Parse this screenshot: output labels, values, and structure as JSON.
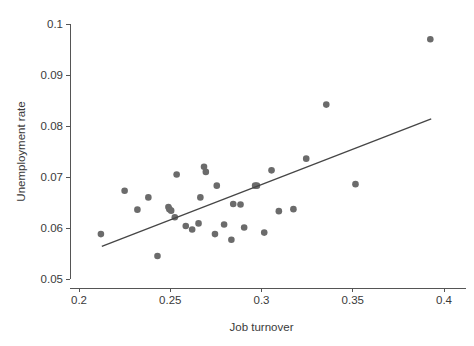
{
  "chart_data": {
    "type": "scatter",
    "title": "",
    "xlabel": "Job turnover",
    "ylabel": "Unemployment rate",
    "xlim": [
      0.2,
      0.4
    ],
    "ylim": [
      0.05,
      0.1
    ],
    "grid": false,
    "legend": null,
    "xticks": [
      0.2,
      0.25,
      0.3,
      0.35,
      0.4
    ],
    "xticklabels": [
      "0.2",
      "0.25",
      "0.3",
      "0.35",
      "0.4"
    ],
    "yticks": [
      0.05,
      0.06,
      0.07,
      0.08,
      0.09,
      0.1
    ],
    "yticklabels": [
      "0.05",
      "0.06",
      "0.07",
      "0.08",
      "0.09",
      "0.1"
    ],
    "marker_color": "#6b6b6b",
    "marker_shape": "circle",
    "marker_size": 4.6,
    "series": [
      {
        "name": "observations",
        "x": [
          0.212,
          0.225,
          0.232,
          0.238,
          0.243,
          0.249,
          0.2495,
          0.2505,
          0.2525,
          0.2535,
          0.2585,
          0.262,
          0.2655,
          0.2665,
          0.2685,
          0.2695,
          0.2745,
          0.2755,
          0.2795,
          0.2835,
          0.2845,
          0.2885,
          0.2905,
          0.2965,
          0.2975,
          0.3015,
          0.3055,
          0.3095,
          0.3175,
          0.3245,
          0.3355,
          0.3515,
          0.3925
        ],
        "y": [
          0.0588,
          0.0673,
          0.0636,
          0.066,
          0.0545,
          0.0641,
          0.0637,
          0.0634,
          0.0621,
          0.0705,
          0.0604,
          0.0597,
          0.0609,
          0.066,
          0.072,
          0.071,
          0.0588,
          0.0683,
          0.0607,
          0.0577,
          0.0647,
          0.0646,
          0.0601,
          0.0683,
          0.0683,
          0.0591,
          0.0713,
          0.0633,
          0.0637,
          0.0736,
          0.0842,
          0.0686,
          0.097
        ]
      }
    ],
    "fit_line": {
      "name": "linear fit",
      "x_start": 0.2125,
      "y_start": 0.0564,
      "x_end": 0.393,
      "y_end": 0.0814,
      "color": "#464646"
    }
  }
}
